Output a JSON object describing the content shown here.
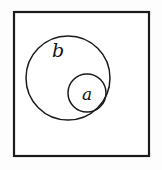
{
  "diagram": {
    "type": "venn-diagram",
    "colors": {
      "stroke": "#1a1a1a",
      "circle_stroke": "#1a1a1a",
      "fill": "#ffffff",
      "background": "#fdfdfd"
    },
    "universe": {
      "name": "universal-set",
      "label": "",
      "x": 14,
      "y": 12,
      "width": 135,
      "height": 144
    },
    "sets": [
      {
        "id": "b",
        "label": "b",
        "cx": 68,
        "cy": 78,
        "r": 42,
        "label_x": 58,
        "label_y": 52
      },
      {
        "id": "a",
        "label": "a",
        "cx": 87,
        "cy": 93,
        "r": 19,
        "label_x": 87,
        "label_y": 95
      }
    ]
  }
}
